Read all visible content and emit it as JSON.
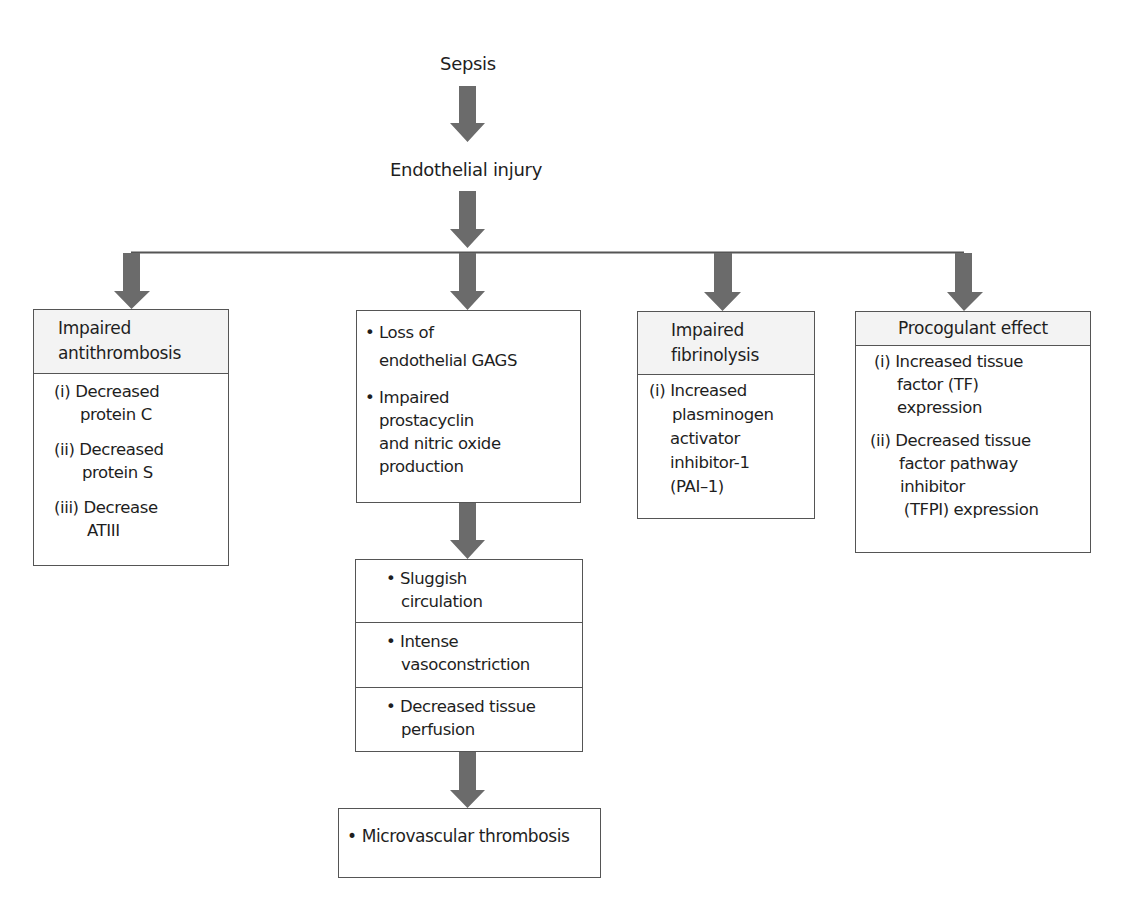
{
  "diagram": {
    "title_node": "Sepsis",
    "second_node": "Endothelial injury",
    "arrow_color": "#6b6b6b",
    "line_color": "#555555",
    "header_fill": "#f3f3f3",
    "branches": {
      "antithrombosis": {
        "header": [
          "Impaired",
          "antithrombosis"
        ],
        "items": [
          {
            "num": "(i)",
            "lines": [
              "Decreased",
              "protein C"
            ]
          },
          {
            "num": "(ii)",
            "lines": [
              "Decreased",
              "protein S"
            ]
          },
          {
            "num": "(iii)",
            "lines": [
              "Decrease",
              "ATIII"
            ]
          }
        ]
      },
      "endothelial": {
        "bullet": "•",
        "items": [
          {
            "lines": [
              "Loss of",
              "endothelial GAGS"
            ]
          },
          {
            "lines": [
              "Impaired",
              "prostacyclin",
              "and nitric oxide",
              "production"
            ]
          }
        ]
      },
      "fibrinolysis": {
        "header": [
          "Impaired",
          "fibrinolysis"
        ],
        "items": [
          {
            "num": "(i)",
            "lines": [
              "Increased",
              "plasminogen",
              "activator",
              "inhibitor-1",
              "(PAI–1)"
            ]
          }
        ]
      },
      "procoagulant": {
        "header": [
          "Procogulant effect"
        ],
        "items": [
          {
            "num": "(i)",
            "lines": [
              "Increased tissue",
              "factor (TF)",
              "expression"
            ]
          },
          {
            "num": "(ii)",
            "lines": [
              "Decreased tissue",
              "factor pathway",
              "inhibitor",
              " (TFPI) expression"
            ]
          }
        ]
      }
    },
    "circulation": {
      "bullet": "•",
      "cells": [
        {
          "lines": [
            "Sluggish",
            "circulation"
          ]
        },
        {
          "lines": [
            "Intense",
            "vasoconstriction"
          ]
        },
        {
          "lines": [
            "Decreased tissue",
            "perfusion"
          ]
        }
      ]
    },
    "outcome": {
      "bullet": "•",
      "text": "Microvascular thrombosis"
    }
  }
}
